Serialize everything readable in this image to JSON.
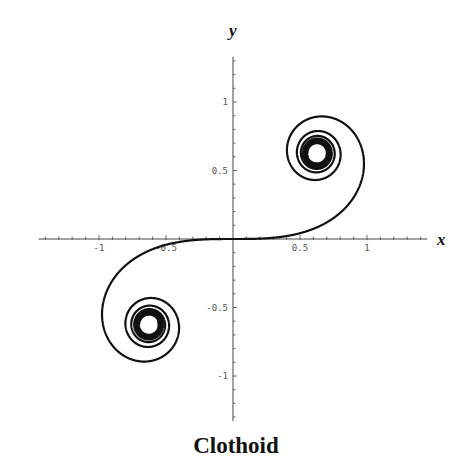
{
  "chart_data": {
    "type": "line",
    "title": "Clothoid",
    "xlabel": "x",
    "ylabel": "y",
    "parametric": {
      "x_expr": "∫₀ᵗ cos(s²) ds",
      "y_expr": "∫₀ᵗ sin(s²) ds",
      "t_range": [
        -7,
        7
      ]
    },
    "xlim": [
      -1.45,
      1.45
    ],
    "ylim": [
      -1.33,
      1.33
    ],
    "x_ticks": [
      -1,
      -0.5,
      0.5,
      1
    ],
    "x_tick_labels": [
      "-1",
      "-0.5",
      "0.5",
      "1"
    ],
    "y_ticks": [
      1,
      0.5,
      -0.5,
      -1
    ],
    "y_tick_labels": [
      "1",
      "0.5",
      "-0.5",
      "-1"
    ],
    "minor_tick_step": 0.1,
    "spiral_centers": [
      [
        0.886,
        0.886
      ],
      [
        -0.886,
        -0.886
      ]
    ],
    "grid": false,
    "legend": null,
    "line_color": "#111111",
    "axis_color": "#444444"
  }
}
